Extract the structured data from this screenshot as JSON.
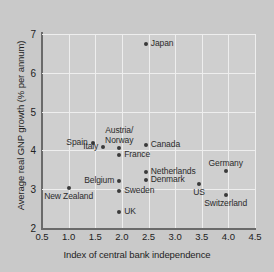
{
  "chart_data": {
    "type": "scatter",
    "title": "",
    "xlabel": "Index of central bank independence",
    "ylabel": "Average real GNP growth (% per annum)",
    "xlim": [
      0.5,
      4.5
    ],
    "ylim": [
      2,
      7
    ],
    "xticks": [
      "0.5",
      "1.0",
      "1.5",
      "2.0",
      "2.5",
      "3.0",
      "3.5",
      "4.0",
      "4.5"
    ],
    "xtick_values": [
      0.5,
      1.0,
      1.5,
      2.0,
      2.5,
      3.0,
      3.5,
      4.0,
      4.5
    ],
    "yticks": [
      "2",
      "3",
      "4",
      "5",
      "6",
      "7"
    ],
    "ytick_values": [
      2,
      3,
      4,
      5,
      6,
      7
    ],
    "grid": true,
    "legend": "none",
    "points": [
      {
        "label": "Japan",
        "x": 2.45,
        "y": 6.75,
        "label_pos": "right"
      },
      {
        "label": "Spain",
        "x": 1.45,
        "y": 4.2,
        "label_pos": "left"
      },
      {
        "label": "Canada",
        "x": 2.45,
        "y": 4.15,
        "label_pos": "right"
      },
      {
        "label": "Italy",
        "x": 1.65,
        "y": 4.08,
        "label_pos": "left"
      },
      {
        "label": "Austria/\nNorway",
        "x": 1.95,
        "y": 4.05,
        "label_pos": "above"
      },
      {
        "label": "France",
        "x": 1.95,
        "y": 3.88,
        "label_pos": "right"
      },
      {
        "label": "Germany",
        "x": 3.95,
        "y": 3.48,
        "label_pos": "above"
      },
      {
        "label": "Netherlands",
        "x": 2.45,
        "y": 3.45,
        "label_pos": "right"
      },
      {
        "label": "Denmark",
        "x": 2.45,
        "y": 3.25,
        "label_pos": "right"
      },
      {
        "label": "Belgium",
        "x": 1.95,
        "y": 3.22,
        "label_pos": "left"
      },
      {
        "label": "US",
        "x": 3.45,
        "y": 3.13,
        "label_pos": "below"
      },
      {
        "label": "New Zealand",
        "x": 1.0,
        "y": 3.02,
        "label_pos": "below"
      },
      {
        "label": "Sweden",
        "x": 1.95,
        "y": 2.95,
        "label_pos": "right"
      },
      {
        "label": "Switzerland",
        "x": 3.95,
        "y": 2.85,
        "label_pos": "below"
      },
      {
        "label": "UK",
        "x": 1.95,
        "y": 2.4,
        "label_pos": "right"
      }
    ]
  },
  "colors": {
    "background": "#c9c9c9",
    "plot_background": "#cfcfcf",
    "gridline": "#eeeeee",
    "axis": "#6a6a6a",
    "marker": "#3a3a3a",
    "text": "#1e1e1e"
  }
}
